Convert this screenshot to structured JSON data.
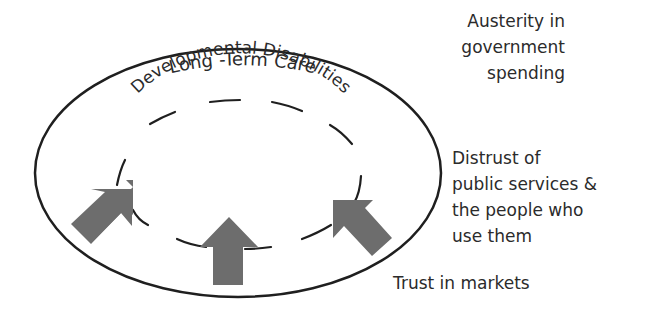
{
  "diagram": {
    "outer_label": "Long -Term Care",
    "inner_label": "Developmental Disabilities",
    "external_factors": [
      {
        "label_lines": [
          "Austerity in",
          "government",
          "spending"
        ]
      },
      {
        "label_lines": [
          "Distrust  of",
          "public services &",
          "the people who",
          "use them"
        ]
      },
      {
        "label_lines": [
          "Trust in markets"
        ]
      }
    ],
    "arrows": [
      {
        "direction": "up-right",
        "position": "bottom-left"
      },
      {
        "direction": "up",
        "position": "bottom-center"
      },
      {
        "direction": "up-left",
        "position": "bottom-right"
      }
    ],
    "colors": {
      "line": "#1f1f1f",
      "arrow_fill": "#6d6d6d",
      "text": "#2b2b2b",
      "background": "#ffffff"
    }
  }
}
